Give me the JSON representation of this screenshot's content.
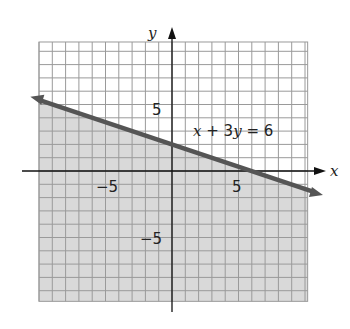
{
  "chart_data": {
    "type": "line",
    "title": "",
    "xlabel": "x",
    "ylabel": "y",
    "xlim": [
      -10,
      10
    ],
    "ylim": [
      -10,
      10
    ],
    "grid": true,
    "x_ticks_labeled": [
      -5,
      5
    ],
    "y_ticks_labeled": [
      5,
      -5
    ],
    "tick_labels": {
      "x_neg": "−5",
      "x_pos": "5",
      "y_pos": "5",
      "y_neg": "−5"
    },
    "series": [
      {
        "name": "x + 3y = 6",
        "kind": "boundary-line",
        "style": "solid",
        "points": [
          [
            -11,
            5.667
          ],
          [
            11,
            -1.667
          ]
        ]
      }
    ],
    "shaded_region": "below line (x + 3y ≤ 6)",
    "annotations": [
      {
        "text": "x + 3y = 6",
        "x": 2,
        "y": 2.5
      }
    ],
    "colors": {
      "shade": "#d9d9d9",
      "grid": "#9a9a9a",
      "line": "#555555",
      "axis": "#111111"
    }
  },
  "labels": {
    "x_axis": "x",
    "y_axis": "y",
    "equation": "x + 3y = 6",
    "x_neg": "−5",
    "x_pos": "5",
    "y_pos": "5",
    "y_neg": "−5"
  }
}
